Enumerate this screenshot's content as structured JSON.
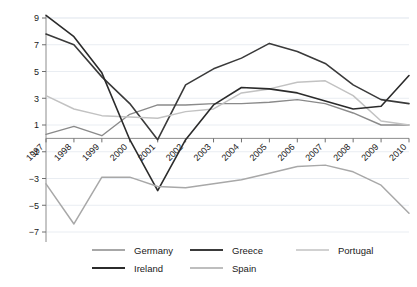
{
  "chart_data": {
    "type": "line",
    "title": "",
    "xlabel": "",
    "ylabel": "",
    "grid": true,
    "legend_position": "bottom",
    "categories": [
      "1997",
      "1998",
      "1999",
      "2000",
      "2001",
      "2002",
      "2003",
      "2004",
      "2005",
      "2006",
      "2007",
      "2008",
      "2009",
      "2010"
    ],
    "ylim": [
      -7,
      9
    ],
    "yticks": [
      9,
      7,
      5,
      3,
      1,
      -1,
      -3,
      -5,
      -7
    ],
    "ytick_labels": [
      "9",
      "7",
      "5",
      "3",
      "1",
      "−1",
      "−3",
      "−5",
      "−7"
    ],
    "series": [
      {
        "name": "Germany",
        "color": "#8a8a8a",
        "width": 1.4,
        "values": [
          0.3,
          0.9,
          0.2,
          1.8,
          2.5,
          2.5,
          2.6,
          2.6,
          2.7,
          2.9,
          2.6,
          1.9,
          1.0,
          1.0
        ]
      },
      {
        "name": "Greece",
        "color": "#3a3a3a",
        "width": 1.6,
        "values": [
          7.8,
          7.0,
          4.6,
          2.6,
          -0.1,
          4.0,
          5.2,
          6.0,
          7.1,
          6.5,
          5.6,
          4.0,
          2.9,
          2.6
        ]
      },
      {
        "name": "Portugal",
        "color": "#c2c2c2",
        "width": 1.5,
        "values": [
          3.2,
          2.2,
          1.7,
          1.6,
          1.5,
          2.0,
          2.2,
          3.4,
          3.7,
          4.2,
          4.3,
          3.2,
          1.3,
          1.0
        ]
      },
      {
        "name": "Ireland",
        "color": "#2b2b2b",
        "width": 1.6,
        "values": [
          9.2,
          7.6,
          4.9,
          -0.1,
          -3.9,
          -0.1,
          2.5,
          3.8,
          3.7,
          3.4,
          2.8,
          2.2,
          2.4,
          4.7
        ]
      },
      {
        "name": "Spain",
        "color": "#a8a8a8",
        "width": 1.5,
        "values": [
          -3.4,
          -6.4,
          -2.9,
          -2.9,
          -3.6,
          -3.7,
          -3.4,
          -3.1,
          -2.6,
          -2.1,
          -2.0,
          -2.5,
          -3.5,
          -5.6
        ]
      }
    ],
    "annotations": []
  },
  "legend": {
    "entries": [
      {
        "label": "Germany"
      },
      {
        "label": "Greece"
      },
      {
        "label": "Portugal"
      },
      {
        "label": "Ireland"
      },
      {
        "label": "Spain"
      }
    ]
  }
}
